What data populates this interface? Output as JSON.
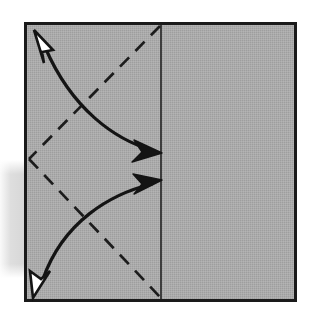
{
  "figure": {
    "type": "diagram"
  },
  "colors": {
    "paper_fill": "#a9a9a9",
    "paper_border": "#1a1a1a",
    "line_stroke": "#1a1a1a",
    "dashed_stroke": "#1a1a1a",
    "arrow_solid_fill": "#1a1a1a",
    "arrow_open_fill": "#ffffff",
    "background": "#ffffff",
    "shadow": "#d9d9d9"
  },
  "sheet": {
    "label": "paper-sheet",
    "x": 24,
    "y": 22,
    "width": 273,
    "height": 280,
    "border_width": 3
  },
  "fold_line": {
    "label": "vertical-fold-line",
    "x": 161,
    "y_top": 24,
    "y_bottom": 300,
    "stroke_width": 1.6,
    "style": "solid"
  },
  "creases": [
    {
      "label": "upper-crease",
      "x1": 161,
      "y1": 26,
      "x2": 29,
      "y2": 159,
      "style": "dashed",
      "dash": "13 9",
      "stroke_width": 2.6
    },
    {
      "label": "lower-crease",
      "x1": 29,
      "y1": 159,
      "x2": 161,
      "y2": 297,
      "style": "dashed",
      "dash": "13 9",
      "stroke_width": 2.6
    }
  ],
  "arrows": [
    {
      "label": "upper-fold-arrow",
      "direction": "right-to-left-up",
      "path": "M 156 150 C 120 140 70 105 42 44",
      "head_start": {
        "x": 37,
        "y": 33,
        "angle": -243,
        "type": "open"
      },
      "head_end": {
        "x": 160,
        "y": 152,
        "angle": 18,
        "type": "solid"
      },
      "stroke_width": 3.2
    },
    {
      "label": "lower-fold-arrow",
      "direction": "left-to-right-up",
      "path": "M 41 283 C 62 224 110 193 155 184",
      "head_start": {
        "x": 36,
        "y": 293,
        "angle": 70,
        "type": "open"
      },
      "head_end": {
        "x": 160,
        "y": 182,
        "angle": -14,
        "type": "solid"
      },
      "stroke_width": 3.2
    }
  ],
  "shadow": {
    "label": "page-shadow",
    "x": 0,
    "y": 160,
    "width": 34,
    "height": 118
  }
}
